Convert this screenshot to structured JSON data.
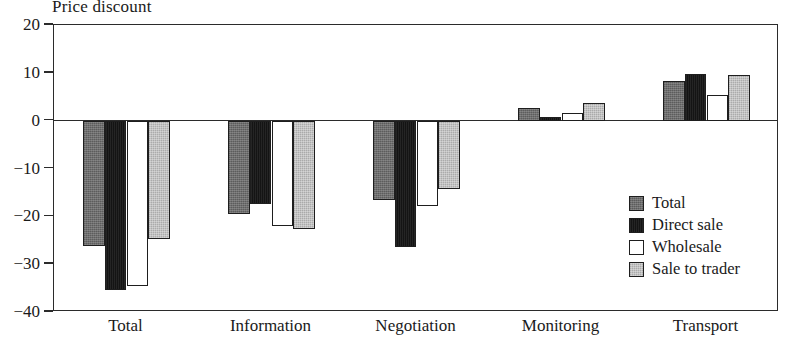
{
  "chart_data": {
    "type": "bar",
    "title": "Price discount",
    "xlabel": "",
    "ylabel": "",
    "ylim": [
      -40,
      20
    ],
    "yticks": [
      20,
      10,
      0,
      -10,
      -20,
      -30,
      -40
    ],
    "ytick_labels": [
      "20",
      "10",
      "0",
      "−10",
      "−20",
      "−30",
      "−40"
    ],
    "grid": false,
    "legend_position": "inside-lower-right",
    "categories": [
      "Total",
      "Information",
      "Negotiation",
      "Monitoring",
      "Transport"
    ],
    "series": [
      {
        "name": "Total",
        "color": "#6e6e6e",
        "values": [
          -26.3,
          -19.6,
          -16.5,
          2.7,
          8.2
        ]
      },
      {
        "name": "Direct sale",
        "color": "#141414",
        "values": [
          -35.4,
          -17.5,
          -26.5,
          0.7,
          9.8
        ]
      },
      {
        "name": "Wholesale",
        "color": "#ffffff",
        "values": [
          -34.5,
          -22.0,
          -17.8,
          1.6,
          5.3
        ]
      },
      {
        "name": "Sale to trader",
        "color": "#c2c2c2",
        "values": [
          -24.8,
          -22.7,
          -14.3,
          3.7,
          9.5
        ]
      }
    ]
  }
}
